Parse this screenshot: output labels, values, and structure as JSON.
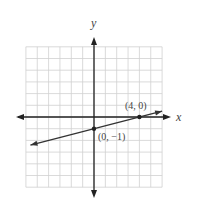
{
  "chart_data": {
    "type": "line",
    "title": "",
    "xlabel": "x",
    "ylabel": "y",
    "xlim": [
      -6,
      6
    ],
    "ylim": [
      -6,
      6
    ],
    "grid": true,
    "grid_step": 1,
    "series": [
      {
        "name": "line through (0, -1) and (4, 0)",
        "equation": "y = x/4 - 1",
        "slope": 0.25,
        "intercept": -1,
        "x": [
          -5.6,
          6
        ],
        "y": [
          -2.4,
          0.5
        ],
        "arrows": "both"
      }
    ],
    "points": [
      {
        "x": 0,
        "y": -1,
        "label": "(0, −1)"
      },
      {
        "x": 4,
        "y": 0,
        "label": "(4, 0)"
      }
    ]
  },
  "labels": {
    "x_axis": "x",
    "y_axis": "y",
    "point_a": "(4, 0)",
    "point_b": "(0, −1)"
  },
  "colors": {
    "grid": "#d0d0d0",
    "axis": "#222222",
    "line": "#333333",
    "text": "#444444"
  }
}
